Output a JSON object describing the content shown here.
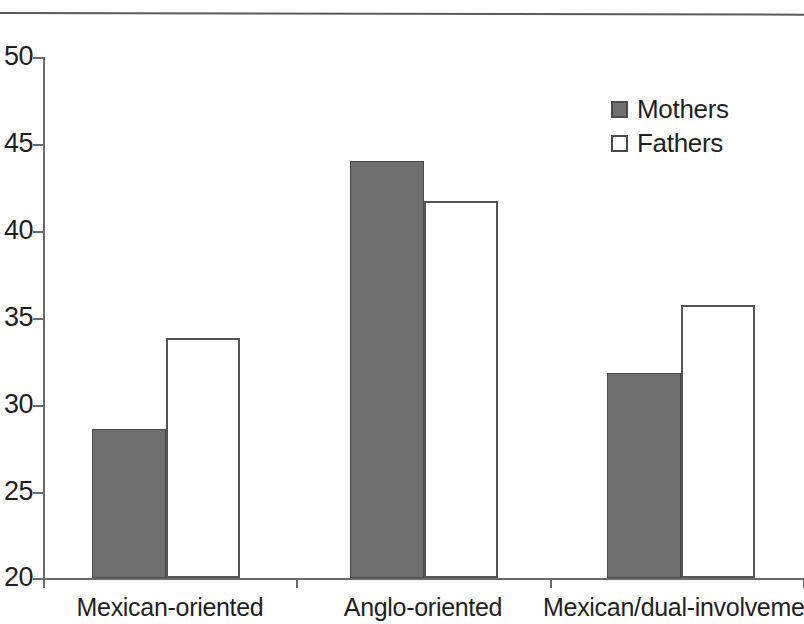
{
  "chart_data": {
    "type": "bar",
    "title": "",
    "xlabel": "",
    "ylabel": "",
    "ylim": [
      20,
      50
    ],
    "ytick_step": 5,
    "yticks": [
      "20",
      "25",
      "30",
      "35",
      "40",
      "45",
      "50"
    ],
    "grid": false,
    "legend_position": "top-right",
    "categories": [
      "Mexican-oriented",
      "Anglo-oriented",
      "Mexican/dual-involvement"
    ],
    "series": [
      {
        "name": "Mothers",
        "color": "#6f6f6f",
        "style": "filled",
        "values": [
          28.6,
          44.0,
          31.8
        ]
      },
      {
        "name": "Fathers",
        "color": "#ffffff",
        "style": "open",
        "values": [
          33.8,
          41.7,
          35.7
        ]
      }
    ]
  },
  "legend": {
    "items": [
      {
        "label": "Mothers",
        "swatch": "filled-square"
      },
      {
        "label": "Fathers",
        "swatch": "open-square"
      }
    ]
  },
  "axis": {
    "y_labels": [
      "50",
      "45",
      "40",
      "35",
      "30",
      "25",
      "20"
    ]
  },
  "colors": {
    "mothers_fill": "#6f6f6f",
    "fathers_fill": "#ffffff",
    "axis_line": "#6a6a6a",
    "text": "#1f1f1f",
    "rule": "#5a5a5a"
  }
}
